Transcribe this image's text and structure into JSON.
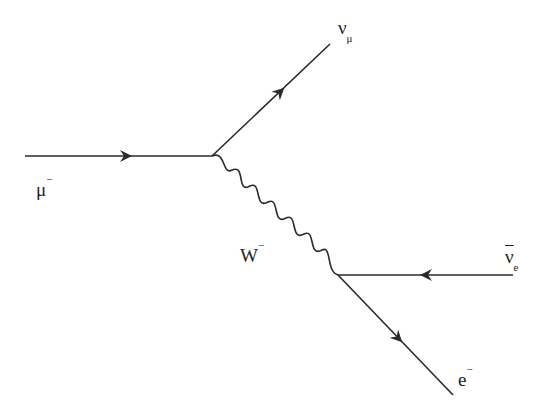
{
  "diagram": {
    "type": "feynman-diagram",
    "colors": {
      "line": "#2a2a2a",
      "background": "#ffffff"
    },
    "vertices": [
      {
        "id": "v1",
        "x": 212,
        "y": 156
      },
      {
        "id": "v2",
        "x": 338,
        "y": 275
      }
    ],
    "particles": {
      "muon": {
        "symbol": "μ",
        "superscript": "−",
        "direction": "in"
      },
      "muon_neutrino": {
        "symbol": "ν",
        "subscript": "μ",
        "direction": "out"
      },
      "w_boson": {
        "symbol": "W",
        "superscript": "−",
        "type": "propagator"
      },
      "electron_antineutrino": {
        "symbol": "ν",
        "subscript": "e",
        "overline": true,
        "direction": "in"
      },
      "electron": {
        "symbol": "e",
        "superscript": "−",
        "direction": "out"
      }
    }
  }
}
